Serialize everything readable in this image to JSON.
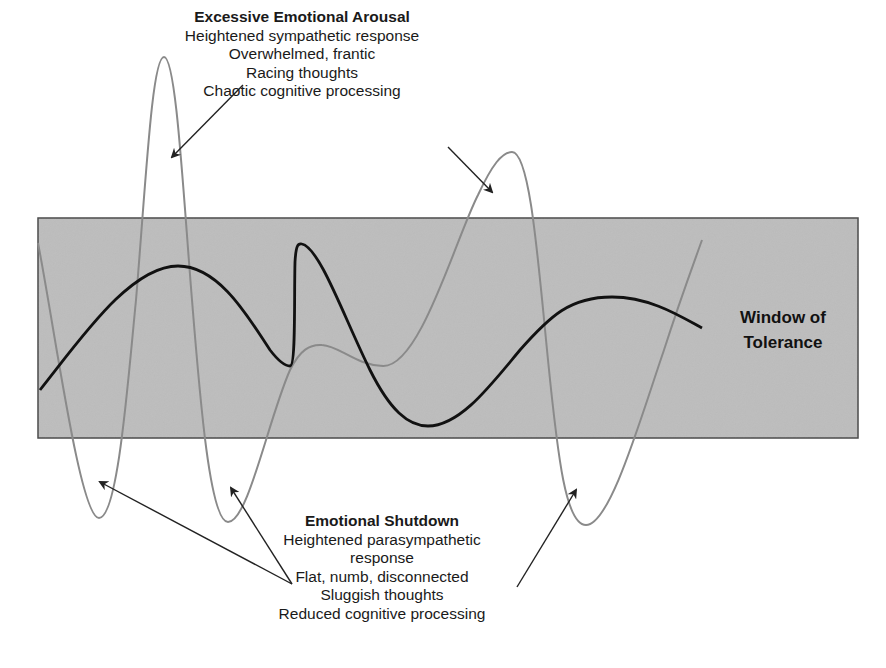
{
  "diagram": {
    "title": "Window of Tolerance",
    "colors": {
      "window_fill": "#bdbdbd",
      "window_border": "#4a4a4a",
      "arousal_curve": "#8a8a8a",
      "regulated_curve": "#111111",
      "arrow": "#222222",
      "background": "#ffffff"
    },
    "window_label": {
      "line1": "Window of",
      "line2": "Tolerance"
    },
    "hyperarousal": {
      "title": "Excessive Emotional Arousal",
      "lines": [
        "Heightened sympathetic response",
        "Overwhelmed, frantic",
        "Racing thoughts",
        "Chaotic cognitive processing"
      ]
    },
    "hypoarousal": {
      "title": "Emotional Shutdown",
      "lines": [
        "Heightened parasympathetic",
        "response",
        "Flat, numb, disconnected",
        "Sluggish thoughts",
        "Reduced cognitive processing"
      ]
    },
    "curves": [
      {
        "name": "dysregulated-curve",
        "description": "Gray line swinging far above and below the window"
      },
      {
        "name": "regulated-curve",
        "description": "Black line staying within the window"
      }
    ]
  }
}
